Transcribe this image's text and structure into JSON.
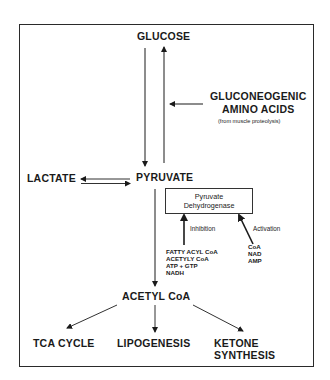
{
  "diagram": {
    "nodes": {
      "glucose": "GLUCOSE",
      "gluconeogenic_line1": "GLUCONEOGENIC",
      "gluconeogenic_line2": "AMINO ACIDS",
      "gluconeogenic_note": "(from muscle proteolysis)",
      "lactate": "LACTATE",
      "pyruvate": "PYRUVATE",
      "acetyl_coa": "ACETYL CoA",
      "tca_cycle": "TCA CYCLE",
      "lipogenesis": "LIPOGENESIS",
      "ketone_line1": "KETONE",
      "ketone_line2": "SYNTHESIS"
    },
    "enzyme": {
      "line1": "Pyruvate",
      "line2": "Dehydrogenase"
    },
    "regulation": {
      "inhibition_label": "Inhibition",
      "inhibitors": [
        "FATTY ACYL CoA",
        "ACETYLY CoA",
        "ATP + GTP",
        "NADH"
      ],
      "activation_label": "Activation",
      "activators": [
        "CoA",
        "NAD",
        "AMP"
      ]
    },
    "edges": [
      {
        "from": "GLUCOSE",
        "to": "PYRUVATE"
      },
      {
        "from": "PYRUVATE",
        "to": "GLUCOSE"
      },
      {
        "from": "GLUCONEOGENIC AMINO ACIDS",
        "to": "GLUCOSE/PYRUVATE pathway"
      },
      {
        "from": "PYRUVATE",
        "to": "LACTATE"
      },
      {
        "from": "LACTATE",
        "to": "PYRUVATE"
      },
      {
        "from": "PYRUVATE",
        "to": "ACETYL CoA"
      },
      {
        "from": "Inhibitors",
        "to": "Pyruvate Dehydrogenase"
      },
      {
        "from": "Activators",
        "to": "Pyruvate Dehydrogenase"
      },
      {
        "from": "ACETYL CoA",
        "to": "TCA CYCLE"
      },
      {
        "from": "ACETYL CoA",
        "to": "LIPOGENESIS"
      },
      {
        "from": "ACETYL CoA",
        "to": "KETONE SYNTHESIS"
      }
    ],
    "colors": {
      "ink": "#1a1a1a",
      "background": "#ffffff"
    }
  }
}
